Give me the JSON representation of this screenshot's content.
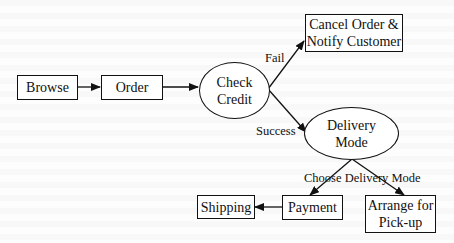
{
  "diagram": {
    "type": "flowchart",
    "colors": {
      "stroke": "#111111",
      "background": "#fdfdfd",
      "node_fill": "#ffffff"
    },
    "nodes": {
      "browse": {
        "label": "Browse",
        "shape": "rectangle"
      },
      "order": {
        "label": "Order",
        "shape": "rectangle"
      },
      "check_credit": {
        "label": "Check\nCredit",
        "shape": "ellipse"
      },
      "cancel": {
        "label": "Cancel Order &\nNotify Customer",
        "shape": "rectangle"
      },
      "delivery_mode": {
        "label": "Delivery\nMode",
        "shape": "ellipse"
      },
      "payment": {
        "label": "Payment",
        "shape": "rectangle"
      },
      "shipping": {
        "label": "Shipping",
        "shape": "rectangle"
      },
      "pickup": {
        "label": "Arrange for\nPick-up",
        "shape": "rectangle"
      }
    },
    "edges": {
      "browse_order": {
        "from": "Browse",
        "to": "Order",
        "label": ""
      },
      "order_check": {
        "from": "Order",
        "to": "Check Credit",
        "label": ""
      },
      "check_cancel": {
        "from": "Check Credit",
        "to": "Cancel Order & Notify Customer",
        "label": "Fail"
      },
      "check_delivery": {
        "from": "Check Credit",
        "to": "Delivery Mode",
        "label": "Success"
      },
      "delivery_payment": {
        "from": "Delivery Mode",
        "to": "Payment",
        "label": ""
      },
      "delivery_pickup": {
        "from": "Delivery Mode",
        "to": "Arrange for Pick-up",
        "label": ""
      },
      "payment_shipping": {
        "from": "Payment",
        "to": "Shipping",
        "label": ""
      }
    },
    "edge_labels": {
      "fail": "Fail",
      "success": "Success",
      "choose_delivery_mode": "Choose Delivery Mode"
    }
  }
}
